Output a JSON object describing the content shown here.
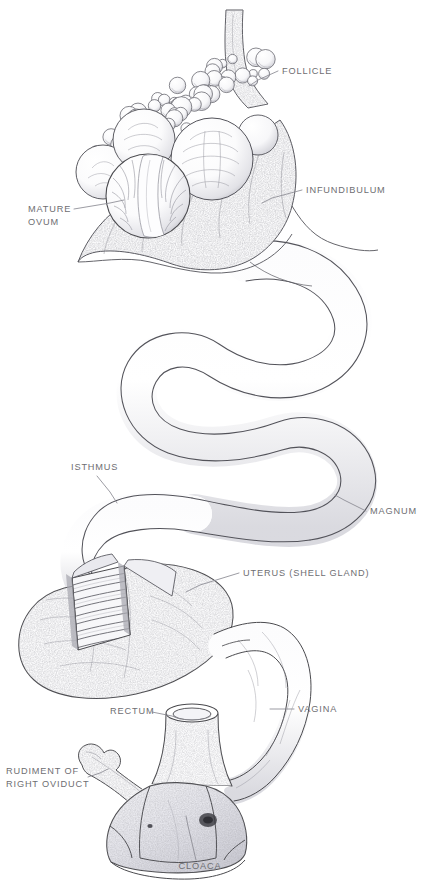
{
  "figure": {
    "style": "pen-and-ink stipple anatomical illustration",
    "background_color": "#ffffff",
    "line_color": "#4a4a4e",
    "label_color": "#6e6e72",
    "shading_color": "#cfcfd4"
  },
  "labels": [
    {
      "id": "follicle",
      "text": "FOLLICLE",
      "lines": [
        "FOLLICLE"
      ],
      "x": 282,
      "y": 74,
      "anchor": "start",
      "leader": [
        [
          278,
          71
        ],
        [
          258,
          80
        ],
        [
          249,
          86
        ]
      ]
    },
    {
      "id": "infundibulum",
      "text": "INFUNDIBULUM",
      "lines": [
        "INFUNDIBULUM"
      ],
      "x": 306,
      "y": 193,
      "anchor": "start",
      "leader": [
        [
          302,
          190
        ],
        [
          272,
          198
        ],
        [
          262,
          203
        ]
      ]
    },
    {
      "id": "mature-ovum",
      "text": "MATURE OVUM",
      "lines": [
        "MATURE",
        "OVUM"
      ],
      "x": 28,
      "y": 212,
      "anchor": "start",
      "leader": [
        [
          74,
          209
        ],
        [
          110,
          203
        ],
        [
          124,
          200
        ]
      ]
    },
    {
      "id": "isthmus",
      "text": "ISTHMUS",
      "lines": [
        "ISTHMUS"
      ],
      "x": 71,
      "y": 470,
      "anchor": "start",
      "leader": [
        [
          97,
          476
        ],
        [
          110,
          492
        ],
        [
          117,
          503
        ]
      ]
    },
    {
      "id": "magnum",
      "text": "MAGNUM",
      "lines": [
        "MAGNUM"
      ],
      "x": 370,
      "y": 514,
      "anchor": "start",
      "leader": [
        [
          366,
          511
        ],
        [
          344,
          500
        ],
        [
          335,
          495
        ]
      ]
    },
    {
      "id": "uterus",
      "text": "UTERUS (SHELL GLAND)",
      "lines": [
        "UTERUS (SHELL GLAND)"
      ],
      "x": 243,
      "y": 576,
      "anchor": "start",
      "leader": [
        [
          239,
          573
        ],
        [
          200,
          585
        ],
        [
          186,
          592
        ]
      ]
    },
    {
      "id": "vagina",
      "text": "VAGINA",
      "lines": [
        "VAGINA"
      ],
      "x": 298,
      "y": 712,
      "anchor": "start",
      "leader": [
        [
          294,
          709
        ],
        [
          278,
          709
        ],
        [
          270,
          709
        ]
      ]
    },
    {
      "id": "rectum",
      "text": "RECTUM",
      "lines": [
        "RECTUM"
      ],
      "x": 110,
      "y": 714,
      "anchor": "start",
      "leader": [
        [
          152,
          712
        ],
        [
          172,
          716
        ],
        [
          180,
          719
        ]
      ]
    },
    {
      "id": "rudiment",
      "text": "RUDIMENT OF RIGHT OVIDUCT",
      "lines": [
        "RUDIMENT OF",
        "RIGHT OVIDUCT"
      ],
      "x": 6,
      "y": 774,
      "anchor": "start",
      "leader": [
        [
          88,
          777
        ],
        [
          100,
          773
        ],
        [
          108,
          769
        ]
      ]
    },
    {
      "id": "cloaca",
      "text": "CLOACA",
      "lines": [
        "CLOACA"
      ],
      "x": 200,
      "y": 869,
      "anchor": "middle",
      "leader": [
        [
          196,
          860
        ],
        [
          188,
          826
        ],
        [
          186,
          816
        ]
      ]
    }
  ],
  "parts": [
    {
      "id": "ovary",
      "name": "ovary-with-follicles",
      "description": "cluster of graded ovarian follicles on stalk"
    },
    {
      "id": "ovary-stalk",
      "name": "ovary-stalk",
      "description": "mesovarium stalk rising to top of plate"
    },
    {
      "id": "mature-ovum",
      "name": "mature-ovum",
      "description": "largest yolk-filled follicle with stigma band"
    },
    {
      "id": "infundibulum",
      "name": "infundibulum",
      "description": "funnel-shaped open mouth of oviduct"
    },
    {
      "id": "magnum",
      "name": "magnum",
      "description": "long coiled albumen-secreting segment"
    },
    {
      "id": "isthmus",
      "name": "isthmus",
      "description": "narrower segment forming shell membranes"
    },
    {
      "id": "uterus",
      "name": "uterus-shell-gland",
      "description": "pouch-like shell gland with cutaway window showing striated folds"
    },
    {
      "id": "vagina",
      "name": "vagina",
      "description": "terminal muscular tube leading to cloaca"
    },
    {
      "id": "rectum",
      "name": "rectum",
      "description": "cut tube entering dorsal cloaca"
    },
    {
      "id": "rudiment",
      "name": "rudiment-right-oviduct",
      "description": "vestigial right oviduct stub"
    },
    {
      "id": "cloaca",
      "name": "cloaca",
      "description": "common terminal chamber"
    }
  ],
  "follicle_cluster": {
    "large_follicles": [
      {
        "cx": 148,
        "cy": 196,
        "r": 42,
        "mature": true
      },
      {
        "cx": 212,
        "cy": 159,
        "r": 41,
        "mature": false
      },
      {
        "cx": 144,
        "cy": 140,
        "r": 31,
        "mature": false
      },
      {
        "cx": 103,
        "cy": 172,
        "r": 27,
        "mature": false
      },
      {
        "cx": 258,
        "cy": 135,
        "r": 20,
        "mature": false
      }
    ],
    "small_follicle_count": 58
  }
}
